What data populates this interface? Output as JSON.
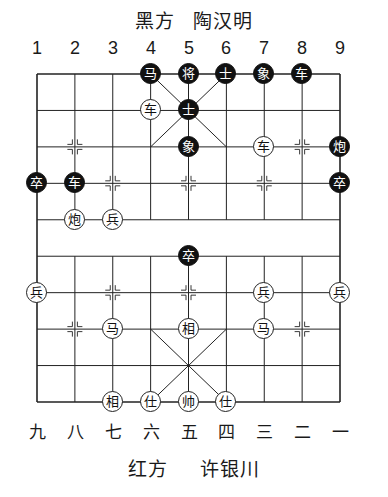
{
  "top_player": {
    "side": "黑方",
    "name": "陶汉明"
  },
  "bottom_player": {
    "side": "红方",
    "name": "许银川"
  },
  "column_labels_top": [
    "1",
    "2",
    "3",
    "4",
    "5",
    "6",
    "7",
    "8",
    "9"
  ],
  "column_labels_bottom": [
    "九",
    "八",
    "七",
    "六",
    "五",
    "四",
    "三",
    "二",
    "一"
  ],
  "board": {
    "files": 9,
    "ranks": 10,
    "river_text": "",
    "colors": {
      "line": "#222222",
      "black_piece": "#111111",
      "red_piece_fill": "#ffffff"
    }
  },
  "pieces": [
    {
      "side": "black",
      "char": "马",
      "col": 4,
      "row": 1
    },
    {
      "side": "black",
      "char": "将",
      "col": 5,
      "row": 1
    },
    {
      "side": "black",
      "char": "士",
      "col": 6,
      "row": 1
    },
    {
      "side": "black",
      "char": "象",
      "col": 7,
      "row": 1
    },
    {
      "side": "black",
      "char": "车",
      "col": 8,
      "row": 1
    },
    {
      "side": "red",
      "char": "车",
      "col": 4,
      "row": 2
    },
    {
      "side": "black",
      "char": "士",
      "col": 5,
      "row": 2
    },
    {
      "side": "black",
      "char": "象",
      "col": 5,
      "row": 3
    },
    {
      "side": "red",
      "char": "车",
      "col": 7,
      "row": 3
    },
    {
      "side": "black",
      "char": "炮",
      "col": 9,
      "row": 3
    },
    {
      "side": "black",
      "char": "卒",
      "col": 1,
      "row": 4
    },
    {
      "side": "black",
      "char": "车",
      "col": 2,
      "row": 4
    },
    {
      "side": "black",
      "char": "卒",
      "col": 9,
      "row": 4
    },
    {
      "side": "red",
      "char": "炮",
      "col": 2,
      "row": 5
    },
    {
      "side": "red",
      "char": "兵",
      "col": 3,
      "row": 5
    },
    {
      "side": "black",
      "char": "卒",
      "col": 5,
      "row": 6
    },
    {
      "side": "red",
      "char": "兵",
      "col": 1,
      "row": 7
    },
    {
      "side": "red",
      "char": "兵",
      "col": 7,
      "row": 7
    },
    {
      "side": "red",
      "char": "兵",
      "col": 9,
      "row": 7
    },
    {
      "side": "red",
      "char": "马",
      "col": 3,
      "row": 8
    },
    {
      "side": "red",
      "char": "相",
      "col": 5,
      "row": 8
    },
    {
      "side": "red",
      "char": "马",
      "col": 7,
      "row": 8
    },
    {
      "side": "red",
      "char": "相",
      "col": 3,
      "row": 10
    },
    {
      "side": "red",
      "char": "仕",
      "col": 4,
      "row": 10
    },
    {
      "side": "red",
      "char": "帅",
      "col": 5,
      "row": 10
    },
    {
      "side": "red",
      "char": "仕",
      "col": 6,
      "row": 10
    }
  ]
}
